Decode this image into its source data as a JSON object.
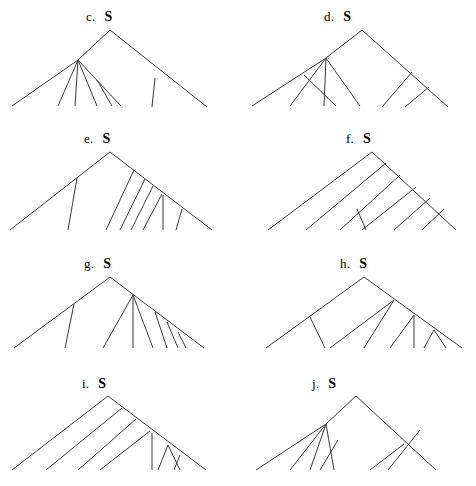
{
  "figure": {
    "type": "syntactic-tree-diagram-set",
    "panel_count": 8,
    "stroke_color": "#3a3a3a",
    "background_color": "#ffffff",
    "root_label": "S"
  },
  "panels": [
    {
      "id": "c",
      "letter": "c.",
      "root": "S",
      "label_x": 86,
      "label_y": 10,
      "apex": [
        110,
        30
      ],
      "lines": [
        [
          110,
          30,
          78,
          60
        ],
        [
          110,
          30,
          207,
          107
        ],
        [
          78,
          60,
          12,
          106
        ],
        [
          78,
          60,
          58,
          106
        ],
        [
          78,
          60,
          75,
          106
        ],
        [
          78,
          60,
          97,
          106
        ],
        [
          78,
          60,
          121,
          106
        ],
        [
          97,
          80,
          112,
          106
        ],
        [
          155,
          78,
          152,
          107
        ]
      ]
    },
    {
      "id": "d",
      "letter": "d.",
      "root": "S",
      "label_x": 324,
      "label_y": 10,
      "apex": [
        362,
        30
      ],
      "lines": [
        [
          362,
          30,
          326,
          58
        ],
        [
          362,
          30,
          448,
          107
        ],
        [
          326,
          58,
          252,
          106
        ],
        [
          326,
          58,
          290,
          106
        ],
        [
          326,
          58,
          324,
          106
        ],
        [
          326,
          58,
          360,
          106
        ],
        [
          304,
          75,
          336,
          106
        ],
        [
          326,
          58,
          326,
          58
        ],
        [
          412,
          72,
          382,
          107
        ],
        [
          429,
          87,
          405,
          107
        ]
      ]
    },
    {
      "id": "e",
      "letter": "e.",
      "root": "S",
      "label_x": 84,
      "label_y": 132,
      "apex": [
        110,
        152
      ],
      "lines": [
        [
          110,
          152,
          10,
          230
        ],
        [
          110,
          152,
          212,
          230
        ],
        [
          77,
          178,
          68,
          230
        ],
        [
          134,
          170,
          106,
          230
        ],
        [
          145,
          179,
          120,
          230
        ],
        [
          153,
          186,
          131,
          230
        ],
        [
          162,
          194,
          143,
          230
        ],
        [
          163,
          195,
          163,
          230
        ],
        [
          182,
          209,
          176,
          230
        ]
      ]
    },
    {
      "id": "f",
      "letter": "f.",
      "root": "S",
      "label_x": 346,
      "label_y": 132,
      "apex": [
        372,
        152
      ],
      "lines": [
        [
          372,
          152,
          268,
          230
        ],
        [
          372,
          152,
          456,
          230
        ],
        [
          386,
          163,
          306,
          230
        ],
        [
          400,
          175,
          340,
          230
        ],
        [
          416,
          187,
          362,
          230
        ],
        [
          357,
          209,
          366,
          230
        ],
        [
          430,
          198,
          394,
          230
        ],
        [
          444,
          209,
          422,
          230
        ]
      ]
    },
    {
      "id": "g",
      "letter": "g.",
      "root": "S",
      "label_x": 84,
      "label_y": 257,
      "apex": [
        110,
        277
      ],
      "lines": [
        [
          110,
          277,
          14,
          348
        ],
        [
          110,
          277,
          204,
          348
        ],
        [
          74,
          304,
          65,
          348
        ],
        [
          133,
          295,
          103,
          348
        ],
        [
          133,
          295,
          133,
          348
        ],
        [
          133,
          295,
          153,
          348
        ],
        [
          155,
          312,
          167,
          348
        ],
        [
          167,
          322,
          178,
          348
        ],
        [
          178,
          332,
          186,
          348
        ]
      ]
    },
    {
      "id": "h",
      "letter": "h.",
      "root": "S",
      "label_x": 340,
      "label_y": 257,
      "apex": [
        364,
        277
      ],
      "lines": [
        [
          364,
          277,
          266,
          348
        ],
        [
          364,
          277,
          462,
          348
        ],
        [
          310,
          317,
          325,
          348
        ],
        [
          394,
          300,
          330,
          348
        ],
        [
          394,
          300,
          364,
          348
        ],
        [
          414,
          315,
          390,
          348
        ],
        [
          414,
          315,
          414,
          348
        ],
        [
          434,
          330,
          424,
          348
        ],
        [
          434,
          330,
          446,
          348
        ]
      ]
    },
    {
      "id": "i",
      "letter": "i.",
      "root": "S",
      "label_x": 82,
      "label_y": 377,
      "apex": [
        108,
        396
      ],
      "lines": [
        [
          108,
          396,
          12,
          470
        ],
        [
          108,
          396,
          206,
          470
        ],
        [
          122,
          408,
          46,
          470
        ],
        [
          136,
          419,
          78,
          470
        ],
        [
          150,
          431,
          100,
          470
        ],
        [
          152,
          433,
          152,
          470
        ],
        [
          168,
          445,
          158,
          470
        ],
        [
          168,
          445,
          180,
          470
        ],
        [
          180,
          455,
          174,
          470
        ]
      ]
    },
    {
      "id": "j",
      "letter": "j.",
      "root": "S",
      "label_x": 312,
      "label_y": 377,
      "apex": [
        356,
        396
      ],
      "lines": [
        [
          356,
          396,
          326,
          424
        ],
        [
          356,
          396,
          436,
          470
        ],
        [
          326,
          424,
          256,
          470
        ],
        [
          326,
          424,
          290,
          470
        ],
        [
          326,
          424,
          310,
          470
        ],
        [
          326,
          424,
          334,
          470
        ],
        [
          338,
          440,
          320,
          470
        ],
        [
          404,
          444,
          370,
          470
        ],
        [
          420,
          430,
          388,
          470
        ]
      ]
    }
  ]
}
